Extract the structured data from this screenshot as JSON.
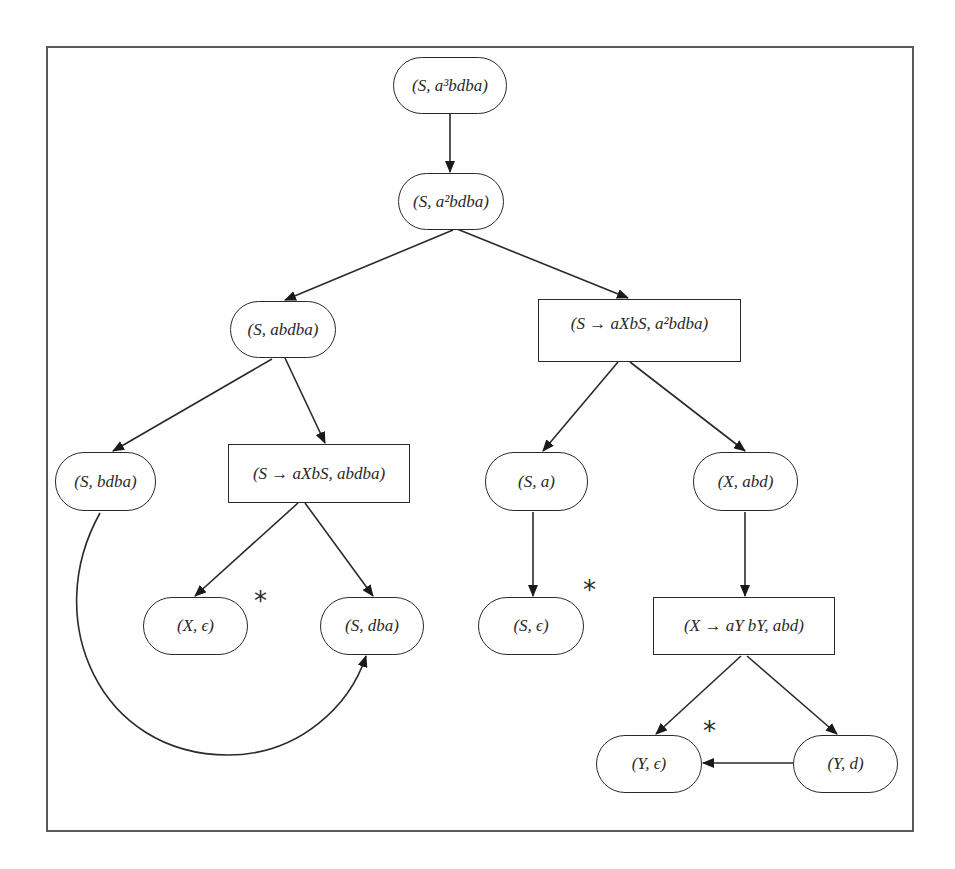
{
  "diagram": {
    "type": "derivation-tree",
    "nodes": [
      {
        "id": "n1",
        "shape": "pill",
        "label": "(S, a³bdba)"
      },
      {
        "id": "n2",
        "shape": "pill",
        "label": "(S, a²bdba)"
      },
      {
        "id": "n3",
        "shape": "pill",
        "label": "(S, abdba)"
      },
      {
        "id": "n4",
        "shape": "box",
        "label": "(S → aXbS, a²bdba)"
      },
      {
        "id": "n5",
        "shape": "pill",
        "label": "(S, bdba)"
      },
      {
        "id": "n6",
        "shape": "box",
        "label": "(S → aXbS, abdba)"
      },
      {
        "id": "n7",
        "shape": "pill",
        "label": "(S, a)"
      },
      {
        "id": "n8",
        "shape": "pill",
        "label": "(X, abd)"
      },
      {
        "id": "n9",
        "shape": "pill",
        "label": "(X, ϵ)",
        "marked": true
      },
      {
        "id": "n10",
        "shape": "pill",
        "label": "(S, dba)"
      },
      {
        "id": "n11",
        "shape": "pill",
        "label": "(S, ϵ)",
        "marked": true
      },
      {
        "id": "n12",
        "shape": "box",
        "label": "(X → aY bY, abd)"
      },
      {
        "id": "n13",
        "shape": "pill",
        "label": "(Y, ϵ)",
        "marked": true
      },
      {
        "id": "n14",
        "shape": "pill",
        "label": "(Y, d)"
      }
    ],
    "edges": [
      {
        "from": "n1",
        "to": "n2"
      },
      {
        "from": "n2",
        "to": "n3"
      },
      {
        "from": "n2",
        "to": "n4"
      },
      {
        "from": "n3",
        "to": "n5"
      },
      {
        "from": "n3",
        "to": "n6"
      },
      {
        "from": "n4",
        "to": "n7"
      },
      {
        "from": "n4",
        "to": "n8"
      },
      {
        "from": "n6",
        "to": "n9"
      },
      {
        "from": "n6",
        "to": "n10"
      },
      {
        "from": "n5",
        "to": "n10",
        "curved": true
      },
      {
        "from": "n7",
        "to": "n11"
      },
      {
        "from": "n8",
        "to": "n12"
      },
      {
        "from": "n12",
        "to": "n13"
      },
      {
        "from": "n12",
        "to": "n14"
      },
      {
        "from": "n14",
        "to": "n13"
      }
    ],
    "marker_symbol": "*"
  },
  "labels": {
    "n1": "(S, a³bdba)",
    "n2": "(S, a²bdba)",
    "n3": "(S, abdba)",
    "n4": "(S → aXbS, a²bdba)",
    "n5": "(S, bdba)",
    "n6": "(S → aXbS, abdba)",
    "n7": "(S, a)",
    "n8": "(X, abd)",
    "n9": "(X, ϵ)",
    "n10": "(S, dba)",
    "n11": "(S, ϵ)",
    "n12": "(X → aY bY, abd)",
    "n13": "(Y, ϵ)",
    "n14": "(Y, d)",
    "star": "*"
  },
  "colors": {
    "stroke": "#2a2a2a",
    "frame": "#5a5a5a",
    "background": "#ffffff"
  }
}
